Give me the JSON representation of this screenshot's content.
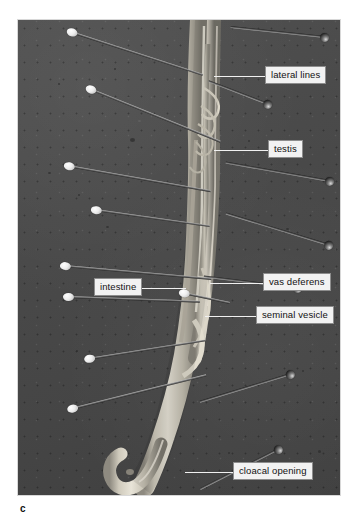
{
  "figure": {
    "caption_letter": "c",
    "plate": {
      "background_color": "#4a4a4a",
      "border_color": "#d8d8d8"
    },
    "label_style": {
      "box_fill": "#f2f2f2",
      "box_border": "#8d8d8d",
      "text_color": "#111111",
      "leader_color": "#f0f0f0"
    }
  },
  "labels": [
    {
      "id": "lateral-lines",
      "text": "lateral lines",
      "box_x": 265,
      "box_y": 66,
      "leader_x": 214,
      "leader_y": 76,
      "leader_w": 51
    },
    {
      "id": "testis",
      "text": "testis",
      "box_x": 268,
      "box_y": 140,
      "leader_x": 214,
      "leader_y": 150,
      "leader_w": 54
    },
    {
      "id": "vas-deferens",
      "text": "vas deferens",
      "box_x": 263,
      "box_y": 273,
      "leader_x": 210,
      "leader_y": 283,
      "leader_w": 53
    },
    {
      "id": "seminal-vesicle",
      "text": "seminal vesicle",
      "box_x": 256,
      "box_y": 306,
      "leader_x": 205,
      "leader_y": 316,
      "leader_w": 51
    },
    {
      "id": "intestine",
      "text": "intestine",
      "box_x": 94,
      "box_y": 278,
      "leader_x": 140,
      "leader_y": 288,
      "leader_w": 46
    },
    {
      "id": "cloacal-opening",
      "text": "cloacal opening",
      "box_x": 233,
      "box_y": 462,
      "leader_x": 185,
      "leader_y": 472,
      "leader_w": 48
    }
  ],
  "pins": [
    {
      "id": "pin-left-1",
      "side": "left",
      "head": "light",
      "x": 71,
      "y": 31,
      "length": 139,
      "angle": 18
    },
    {
      "id": "pin-left-2",
      "side": "left",
      "head": "light",
      "x": 90,
      "y": 88,
      "length": 141,
      "angle": 22
    },
    {
      "id": "pin-left-3",
      "side": "left",
      "head": "light",
      "x": 68,
      "y": 165,
      "length": 145,
      "angle": 10
    },
    {
      "id": "pin-left-4",
      "side": "left",
      "head": "light",
      "x": 95,
      "y": 209,
      "length": 116,
      "angle": 8
    },
    {
      "id": "pin-left-5",
      "side": "left",
      "head": "light",
      "x": 64,
      "y": 265,
      "length": 148,
      "angle": 5
    },
    {
      "id": "pin-left-6",
      "side": "left",
      "head": "light",
      "x": 67,
      "y": 296,
      "length": 133,
      "angle": 2
    },
    {
      "id": "pin-left-7",
      "side": "left",
      "head": "light",
      "x": 88,
      "y": 358,
      "length": 119,
      "angle": -9
    },
    {
      "id": "pin-left-8",
      "side": "left",
      "head": "light",
      "x": 71,
      "y": 408,
      "length": 139,
      "angle": -14
    },
    {
      "id": "pin-mid-1",
      "side": "left",
      "head": "light",
      "x": 183,
      "y": 292,
      "length": 48,
      "angle": 12
    },
    {
      "id": "pin-right-1",
      "side": "right",
      "head": "dark",
      "x": 325,
      "y": 38,
      "length": 95,
      "angle": 186
    },
    {
      "id": "pin-right-2",
      "side": "right",
      "head": "dark",
      "x": 268,
      "y": 105,
      "length": 64,
      "angle": 201
    },
    {
      "id": "pin-right-3",
      "side": "right",
      "head": "dark",
      "x": 330,
      "y": 182,
      "length": 106,
      "angle": 190
    },
    {
      "id": "pin-right-4",
      "side": "right",
      "head": "dark",
      "x": 329,
      "y": 246,
      "length": 108,
      "angle": 197
    },
    {
      "id": "pin-right-5",
      "side": "right",
      "head": "dark",
      "x": 298,
      "y": 289,
      "length": 95,
      "angle": 187
    },
    {
      "id": "pin-right-6",
      "side": "right",
      "head": "dark",
      "x": 291,
      "y": 375,
      "length": 95,
      "angle": 163
    },
    {
      "id": "pin-right-7",
      "side": "right",
      "head": "dark",
      "x": 279,
      "y": 450,
      "length": 88,
      "angle": 153
    }
  ]
}
